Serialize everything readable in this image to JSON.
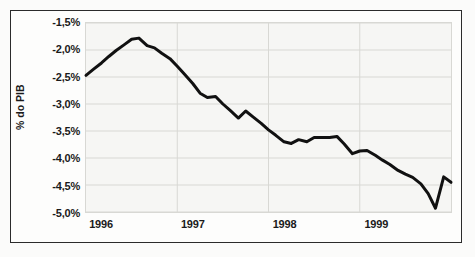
{
  "chart_data": {
    "type": "line",
    "title": "",
    "subtitle": "",
    "xlabel": "",
    "ylabel": "% do PIB",
    "ylim": [
      -5.0,
      -1.5
    ],
    "xlim": [
      1996.0,
      2000.0
    ],
    "ytick_labels": [
      "-1,5%",
      "-2,0%",
      "-2,5%",
      "-3,0%",
      "-3,5%",
      "-4,0%",
      "-4,5%",
      "-5,0%"
    ],
    "ytick_values": [
      -1.5,
      -2.0,
      -2.5,
      -3.0,
      -3.5,
      -4.0,
      -4.5,
      -5.0
    ],
    "xtick_labels": [
      "1996",
      "1997",
      "1998",
      "1999"
    ],
    "xtick_values": [
      1996,
      1997,
      1998,
      1999
    ],
    "grid": true,
    "legend": "none",
    "line_color": "#111111",
    "grid_color": "#d8d8d4",
    "plot_background": "#f6f6f4",
    "series": [
      {
        "name": "% do PIB",
        "x": [
          1996.0,
          1996.08,
          1996.17,
          1996.25,
          1996.33,
          1996.42,
          1996.5,
          1996.58,
          1996.67,
          1996.75,
          1996.83,
          1996.92,
          1997.0,
          1997.08,
          1997.17,
          1997.25,
          1997.33,
          1997.42,
          1997.5,
          1997.58,
          1997.67,
          1997.75,
          1997.83,
          1997.92,
          1998.0,
          1998.08,
          1998.17,
          1998.25,
          1998.33,
          1998.42,
          1998.5,
          1998.58,
          1998.67,
          1998.75,
          1998.83,
          1998.92,
          1999.0,
          1999.08,
          1999.17,
          1999.25,
          1999.33,
          1999.42,
          1999.5,
          1999.58,
          1999.67,
          1999.75,
          1999.83,
          1999.92,
          2000.0
        ],
        "values": [
          -2.47,
          -2.36,
          -2.24,
          -2.12,
          -2.01,
          -1.9,
          -1.8,
          -1.78,
          -1.92,
          -1.96,
          -2.06,
          -2.16,
          -2.3,
          -2.45,
          -2.62,
          -2.8,
          -2.88,
          -2.86,
          -3.0,
          -3.12,
          -3.26,
          -3.13,
          -3.24,
          -3.36,
          -3.48,
          -3.58,
          -3.7,
          -3.73,
          -3.66,
          -3.7,
          -3.62,
          -3.62,
          -3.62,
          -3.6,
          -3.74,
          -3.92,
          -3.87,
          -3.86,
          -3.95,
          -4.04,
          -4.12,
          -4.23,
          -4.3,
          -4.36,
          -4.48,
          -4.66,
          -4.93,
          -4.35,
          -4.45
        ]
      }
    ]
  },
  "axes": {
    "y_title": "% do PIB"
  }
}
